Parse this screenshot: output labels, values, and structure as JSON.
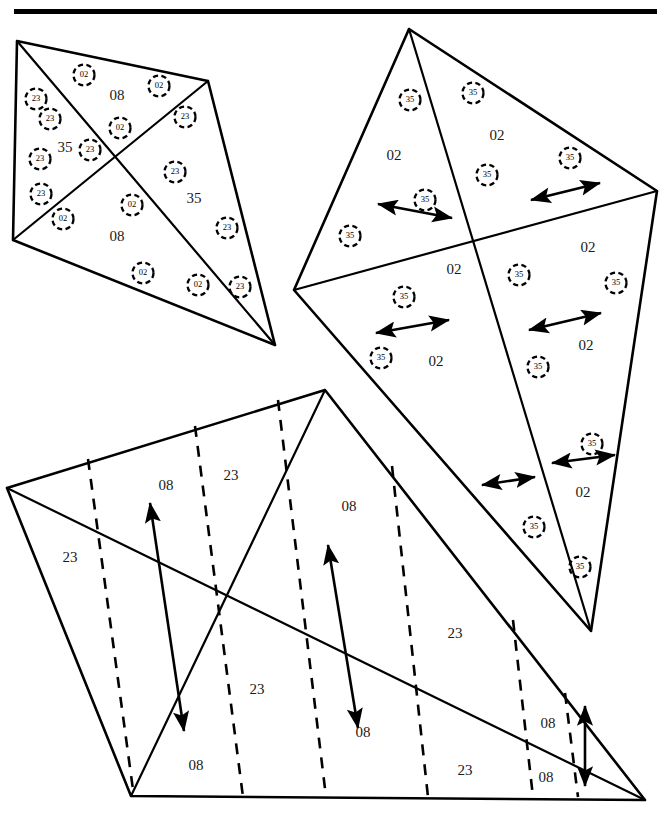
{
  "figure": {
    "background_color": "#ffffff",
    "stroke_color": "#000000",
    "label_color": "#1a1a1a",
    "width": 671,
    "height": 814
  },
  "top_rule": {
    "name": "horizontal-rule",
    "x": 14,
    "y": 9,
    "width": 643,
    "height": 5
  },
  "shapes": [
    {
      "id": "kite-top-left",
      "label": "Top-left kite",
      "outline": [
        [
          17,
          41
        ],
        [
          208,
          81
        ],
        [
          275,
          345
        ],
        [
          13,
          240
        ]
      ],
      "internal_lines": [
        [
          [
            17,
            41
          ],
          [
            275,
            345
          ]
        ],
        [
          [
            13,
            240
          ],
          [
            208,
            81
          ]
        ]
      ],
      "region_labels": [
        {
          "text": "08",
          "x": 117,
          "y": 97
        },
        {
          "text": "35",
          "x": 65,
          "y": 149
        },
        {
          "text": "35",
          "x": 194,
          "y": 200
        },
        {
          "text": "08",
          "x": 117,
          "y": 238
        }
      ],
      "markers": [
        {
          "text": "02",
          "x": 84,
          "y": 75
        },
        {
          "text": "02",
          "x": 159,
          "y": 86
        },
        {
          "text": "23",
          "x": 36,
          "y": 99
        },
        {
          "text": "23",
          "x": 50,
          "y": 119
        },
        {
          "text": "02",
          "x": 120,
          "y": 128
        },
        {
          "text": "23",
          "x": 185,
          "y": 117
        },
        {
          "text": "23",
          "x": 40,
          "y": 159
        },
        {
          "text": "23",
          "x": 90,
          "y": 150
        },
        {
          "text": "23",
          "x": 41,
          "y": 194
        },
        {
          "text": "23",
          "x": 175,
          "y": 172
        },
        {
          "text": "02",
          "x": 63,
          "y": 219
        },
        {
          "text": "02",
          "x": 132,
          "y": 205
        },
        {
          "text": "23",
          "x": 227,
          "y": 228
        },
        {
          "text": "02",
          "x": 143,
          "y": 273
        },
        {
          "text": "02",
          "x": 198,
          "y": 285
        },
        {
          "text": "23",
          "x": 240,
          "y": 287
        }
      ]
    },
    {
      "id": "kite-right",
      "label": "Right kite",
      "outline": [
        [
          409,
          29
        ],
        [
          657,
          191
        ],
        [
          591,
          631
        ],
        [
          294,
          290
        ]
      ],
      "internal_lines": [
        [
          [
            409,
            29
          ],
          [
            591,
            631
          ]
        ],
        [
          [
            294,
            290
          ],
          [
            657,
            191
          ]
        ]
      ],
      "region_labels": [
        {
          "text": "02",
          "x": 394,
          "y": 157
        },
        {
          "text": "02",
          "x": 497,
          "y": 137
        },
        {
          "text": "02",
          "x": 454,
          "y": 271
        },
        {
          "text": "02",
          "x": 588,
          "y": 249
        },
        {
          "text": "02",
          "x": 436,
          "y": 363
        },
        {
          "text": "02",
          "x": 586,
          "y": 347
        },
        {
          "text": "02",
          "x": 583,
          "y": 494
        }
      ],
      "markers": [
        {
          "text": "35",
          "x": 410,
          "y": 100
        },
        {
          "text": "35",
          "x": 473,
          "y": 93
        },
        {
          "text": "35",
          "x": 487,
          "y": 175
        },
        {
          "text": "35",
          "x": 570,
          "y": 158
        },
        {
          "text": "35",
          "x": 425,
          "y": 200
        },
        {
          "text": "35",
          "x": 350,
          "y": 236
        },
        {
          "text": "35",
          "x": 404,
          "y": 297
        },
        {
          "text": "35",
          "x": 519,
          "y": 275
        },
        {
          "text": "35",
          "x": 616,
          "y": 283
        },
        {
          "text": "35",
          "x": 381,
          "y": 358
        },
        {
          "text": "35",
          "x": 538,
          "y": 367
        },
        {
          "text": "35",
          "x": 592,
          "y": 444
        },
        {
          "text": "35",
          "x": 534,
          "y": 527
        },
        {
          "text": "35",
          "x": 580,
          "y": 567
        }
      ],
      "arrows": [
        {
          "from": [
            378,
            204
          ],
          "to": [
            452,
            218
          ],
          "double": true
        },
        {
          "from": [
            531,
            200
          ],
          "to": [
            600,
            183
          ],
          "double": true
        },
        {
          "from": [
            376,
            333
          ],
          "to": [
            449,
            320
          ],
          "double": true
        },
        {
          "from": [
            529,
            330
          ],
          "to": [
            601,
            313
          ],
          "double": true
        },
        {
          "from": [
            482,
            485
          ],
          "to": [
            535,
            477
          ],
          "double": true
        },
        {
          "from": [
            552,
            463
          ],
          "to": [
            615,
            455
          ],
          "double": true
        }
      ]
    },
    {
      "id": "polygon-bottom",
      "label": "Bottom polygon",
      "outline": [
        [
          7,
          488
        ],
        [
          325,
          390
        ],
        [
          645,
          800
        ],
        [
          131,
          796
        ]
      ],
      "internal_lines": [
        [
          [
            7,
            488
          ],
          [
            645,
            800
          ]
        ],
        [
          [
            325,
            390
          ],
          [
            131,
            796
          ]
        ]
      ],
      "region_labels": [
        {
          "text": "08",
          "x": 166,
          "y": 487
        },
        {
          "text": "23",
          "x": 231,
          "y": 477
        },
        {
          "text": "23",
          "x": 70,
          "y": 559
        },
        {
          "text": "08",
          "x": 349,
          "y": 508
        },
        {
          "text": "23",
          "x": 257,
          "y": 691
        },
        {
          "text": "08",
          "x": 196,
          "y": 767
        },
        {
          "text": "08",
          "x": 363,
          "y": 734
        },
        {
          "text": "23",
          "x": 455,
          "y": 635
        },
        {
          "text": "23",
          "x": 465,
          "y": 772
        },
        {
          "text": "08",
          "x": 548,
          "y": 725
        },
        {
          "text": "08",
          "x": 546,
          "y": 779
        }
      ],
      "dashed_folds": [
        [
          [
            88,
            459
          ],
          [
            134,
            797
          ]
        ],
        [
          [
            195,
            426
          ],
          [
            243,
            797
          ]
        ],
        [
          [
            278,
            400
          ],
          [
            326,
            797
          ]
        ],
        [
          [
            392,
            466
          ],
          [
            428,
            797
          ]
        ],
        [
          [
            513,
            620
          ],
          [
            533,
            797
          ]
        ],
        [
          [
            565,
            693
          ],
          [
            578,
            797
          ]
        ]
      ],
      "arrows": [
        {
          "from": [
            184,
            731
          ],
          "to": [
            150,
            503
          ],
          "double": true
        },
        {
          "from": [
            358,
            728
          ],
          "to": [
            328,
            545
          ],
          "double": true
        },
        {
          "from": [
            585,
            786
          ],
          "to": [
            585,
            706
          ],
          "double": true
        }
      ]
    }
  ]
}
